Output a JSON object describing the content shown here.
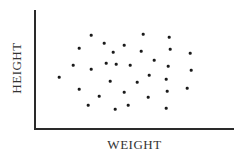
{
  "chart_data": {
    "type": "scatter",
    "title": "",
    "xlabel": "WEIGHT",
    "ylabel": "HEIGHT",
    "grid": false,
    "legend": null,
    "ticks": {
      "x": [],
      "y": []
    },
    "note": "Unlabeled axes; coordinates given in plot pixel space (x right from y-axis, y up from x-axis)",
    "xlim": [
      0,
      200
    ],
    "ylim": [
      0,
      120
    ],
    "points": [
      {
        "x": 56,
        "y": 94
      },
      {
        "x": 108,
        "y": 95
      },
      {
        "x": 134,
        "y": 92
      },
      {
        "x": 44,
        "y": 81
      },
      {
        "x": 69,
        "y": 86
      },
      {
        "x": 89,
        "y": 84
      },
      {
        "x": 78,
        "y": 77
      },
      {
        "x": 106,
        "y": 78
      },
      {
        "x": 135,
        "y": 80
      },
      {
        "x": 155,
        "y": 76
      },
      {
        "x": 38,
        "y": 64
      },
      {
        "x": 56,
        "y": 60
      },
      {
        "x": 71,
        "y": 66
      },
      {
        "x": 81,
        "y": 65
      },
      {
        "x": 95,
        "y": 64
      },
      {
        "x": 119,
        "y": 69
      },
      {
        "x": 133,
        "y": 63
      },
      {
        "x": 156,
        "y": 59
      },
      {
        "x": 24,
        "y": 52
      },
      {
        "x": 75,
        "y": 48
      },
      {
        "x": 102,
        "y": 47
      },
      {
        "x": 114,
        "y": 54
      },
      {
        "x": 131,
        "y": 50
      },
      {
        "x": 44,
        "y": 40
      },
      {
        "x": 64,
        "y": 33
      },
      {
        "x": 89,
        "y": 37
      },
      {
        "x": 113,
        "y": 32
      },
      {
        "x": 132,
        "y": 38
      },
      {
        "x": 152,
        "y": 41
      },
      {
        "x": 53,
        "y": 24
      },
      {
        "x": 80,
        "y": 20
      },
      {
        "x": 93,
        "y": 24
      },
      {
        "x": 131,
        "y": 21
      }
    ],
    "colors": {
      "points": "#1a1a1a",
      "axes": "#2a2a2a",
      "text": "#333333"
    }
  }
}
